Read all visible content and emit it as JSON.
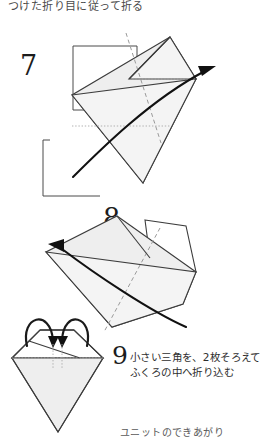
{
  "document": {
    "kind": "origami-instruction-diagram",
    "language": "ja",
    "top_note": "つけた折り目に従って折る",
    "bottom_caption": "ユニットのできあがり"
  },
  "steps": [
    {
      "number": "7",
      "caption": "",
      "diagram": {
        "name": "tilted-kite-fold",
        "arrow": "curved-fold-arrow-right",
        "creases": [
          "dashed-diagonal",
          "dotted-horizontal"
        ]
      }
    },
    {
      "number": "8",
      "caption": "",
      "diagram": {
        "name": "tilted-kite-fold-back",
        "arrow": "curved-fold-arrow-left",
        "creases": [
          "dashed-diagonal"
        ]
      }
    },
    {
      "number": "9",
      "caption_line1": "小さい三角を、2枚そろえて",
      "caption_line2": "ふくろの中へ折り込む",
      "diagram": {
        "name": "finished-unit-kite",
        "arrow": "two-tuck-arrows",
        "creases": [
          "dotted-horizontal"
        ]
      }
    }
  ],
  "colors": {
    "paper_fill": "#eeeeee",
    "paper_fill_light": "#f4f4f4",
    "outline": "#3c3c3c",
    "crease": "#9a9a9a",
    "arrow": "#111111",
    "text": "#2e2e2e",
    "background": "#ffffff"
  }
}
